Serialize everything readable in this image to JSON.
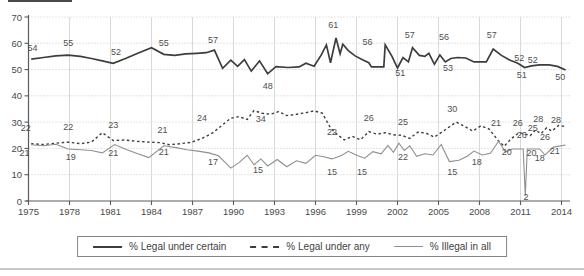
{
  "colors": {
    "line_dark": "#3d3d3d",
    "line_light": "#8f8f8f",
    "grid_vertical": "#d9d9d9",
    "grid_horizontal": "#c9c9c9",
    "axis": "#5a5a5a",
    "tick_text": "#4a4a4a",
    "data_label": "#4f4f4f",
    "divider": "#c9c9c9"
  },
  "chart_data": {
    "type": "line",
    "title": "",
    "xlabel": "",
    "ylabel": "",
    "xlim": [
      1975,
      2014.7
    ],
    "ylim": [
      0,
      70
    ],
    "grid": true,
    "legend_position": "bottom",
    "x_ticks": [
      1975,
      1978,
      1981,
      1984,
      1987,
      1990,
      1993,
      1996,
      1999,
      2002,
      2005,
      2008,
      2011,
      2014
    ],
    "y_ticks": [
      0,
      10,
      20,
      30,
      40,
      50,
      60,
      70
    ],
    "series": [
      {
        "name": "% Legal under certain",
        "style": "solid-thick",
        "points": [
          [
            1975.2,
            54
          ],
          [
            1976.1,
            54.6
          ],
          [
            1977.0,
            55.2
          ],
          [
            1977.9,
            55.5
          ],
          [
            1978.8,
            55.0
          ],
          [
            1979.6,
            54.2
          ],
          [
            1980.4,
            53.3
          ],
          [
            1981.2,
            52.4
          ],
          [
            1982.1,
            54.2
          ],
          [
            1983.0,
            56.2
          ],
          [
            1984.0,
            58.3
          ],
          [
            1984.9,
            55.8
          ],
          [
            1985.7,
            55.4
          ],
          [
            1986.5,
            56.0
          ],
          [
            1987.3,
            56.2
          ],
          [
            1988.0,
            56.4
          ],
          [
            1988.6,
            57.4
          ],
          [
            1989.2,
            50.5
          ],
          [
            1989.8,
            53.6
          ],
          [
            1990.3,
            51.2
          ],
          [
            1990.8,
            53.8
          ],
          [
            1991.3,
            49.4
          ],
          [
            1991.9,
            53.3
          ],
          [
            1992.5,
            48.4
          ],
          [
            1993.1,
            51.1
          ],
          [
            1994.0,
            50.8
          ],
          [
            1994.8,
            51.0
          ],
          [
            1995.3,
            52.4
          ],
          [
            1995.9,
            51.3
          ],
          [
            1996.4,
            55.4
          ],
          [
            1996.8,
            59.4
          ],
          [
            1997.1,
            52.6
          ],
          [
            1997.5,
            62.0
          ],
          [
            1997.8,
            56.0
          ],
          [
            1998.0,
            59.6
          ],
          [
            1998.4,
            57.2
          ],
          [
            1998.9,
            55.2
          ],
          [
            1999.4,
            53.8
          ],
          [
            1999.9,
            52.6
          ],
          [
            2000.1,
            51.0
          ],
          [
            2001.0,
            51.0
          ],
          [
            2001.1,
            59.4
          ],
          [
            2001.6,
            55.0
          ],
          [
            2002.0,
            50.6
          ],
          [
            2002.4,
            54.6
          ],
          [
            2002.8,
            52.9
          ],
          [
            2003.1,
            58.3
          ],
          [
            2003.6,
            55.4
          ],
          [
            2004.0,
            55.0
          ],
          [
            2004.3,
            56.2
          ],
          [
            2004.7,
            52.0
          ],
          [
            2005.1,
            55.6
          ],
          [
            2005.5,
            52.9
          ],
          [
            2005.9,
            54.2
          ],
          [
            2006.4,
            54.6
          ],
          [
            2007.0,
            54.4
          ],
          [
            2007.6,
            52.9
          ],
          [
            2008.5,
            52.9
          ],
          [
            2009.0,
            57.8
          ],
          [
            2009.6,
            55.4
          ],
          [
            2010.2,
            53.6
          ],
          [
            2010.8,
            52.4
          ],
          [
            2011.3,
            50.8
          ],
          [
            2011.8,
            51.4
          ],
          [
            2012.4,
            51.8
          ],
          [
            2013.1,
            51.8
          ],
          [
            2013.7,
            51.2
          ],
          [
            2014.3,
            49.8
          ]
        ],
        "labels": [
          {
            "x": 1975.3,
            "y": 58.2,
            "t": "54"
          },
          {
            "x": 1977.9,
            "y": 60.1,
            "t": "55"
          },
          {
            "x": 1981.4,
            "y": 56.7,
            "t": "52"
          },
          {
            "x": 1984.9,
            "y": 60.1,
            "t": "55"
          },
          {
            "x": 1988.5,
            "y": 61.2,
            "t": "57"
          },
          {
            "x": 1992.5,
            "y": 43.7,
            "t": "48"
          },
          {
            "x": 1997.3,
            "y": 66.9,
            "t": "61"
          },
          {
            "x": 1999.8,
            "y": 60.5,
            "t": "56"
          },
          {
            "x": 2002.9,
            "y": 63.1,
            "t": "57"
          },
          {
            "x": 2002.2,
            "y": 48.7,
            "t": "51"
          },
          {
            "x": 2005.4,
            "y": 62.4,
            "t": "56"
          },
          {
            "x": 2005.7,
            "y": 50.6,
            "t": "53"
          },
          {
            "x": 2008.9,
            "y": 63.1,
            "t": "57"
          },
          {
            "x": 2010.9,
            "y": 54.4,
            "t": "52"
          },
          {
            "x": 2011.9,
            "y": 53.6,
            "t": "52"
          },
          {
            "x": 2011.1,
            "y": 47.9,
            "t": "51"
          },
          {
            "x": 2013.9,
            "y": 47.2,
            "t": "50"
          }
        ]
      },
      {
        "name": "% Legal under any",
        "style": "dashed",
        "points": [
          [
            1975.2,
            21.8
          ],
          [
            1976.1,
            21.5
          ],
          [
            1977.0,
            22.0
          ],
          [
            1977.9,
            22.4
          ],
          [
            1978.8,
            21.8
          ],
          [
            1979.6,
            22.4
          ],
          [
            1980.4,
            26.0
          ],
          [
            1981.2,
            23.0
          ],
          [
            1982.0,
            23.2
          ],
          [
            1982.9,
            22.7
          ],
          [
            1983.8,
            22.4
          ],
          [
            1984.6,
            22.2
          ],
          [
            1985.3,
            21.4
          ],
          [
            1986.1,
            21.8
          ],
          [
            1986.9,
            22.3
          ],
          [
            1987.7,
            23.8
          ],
          [
            1988.5,
            26.0
          ],
          [
            1989.2,
            29.0
          ],
          [
            1989.8,
            31.5
          ],
          [
            1990.4,
            32.1
          ],
          [
            1991.0,
            31.0
          ],
          [
            1991.5,
            34.4
          ],
          [
            1992.1,
            33.4
          ],
          [
            1992.7,
            33.0
          ],
          [
            1993.3,
            34.0
          ],
          [
            1993.9,
            32.5
          ],
          [
            1994.6,
            33.0
          ],
          [
            1995.3,
            33.6
          ],
          [
            1995.9,
            34.3
          ],
          [
            1996.5,
            33.4
          ],
          [
            1997.1,
            27.8
          ],
          [
            1997.6,
            25.3
          ],
          [
            1998.1,
            23.2
          ],
          [
            1998.7,
            24.6
          ],
          [
            1999.3,
            23.3
          ],
          [
            1999.9,
            26.4
          ],
          [
            2000.5,
            25.4
          ],
          [
            2001.1,
            26.0
          ],
          [
            2001.7,
            25.2
          ],
          [
            2002.3,
            25.0
          ],
          [
            2002.9,
            23.8
          ],
          [
            2003.5,
            26.2
          ],
          [
            2004.1,
            25.8
          ],
          [
            2004.7,
            24.3
          ],
          [
            2005.3,
            26.4
          ],
          [
            2005.9,
            28.6
          ],
          [
            2006.3,
            30.0
          ],
          [
            2006.9,
            28.4
          ],
          [
            2007.5,
            26.6
          ],
          [
            2008.1,
            28.6
          ],
          [
            2008.7,
            27.4
          ],
          [
            2009.3,
            23.4
          ],
          [
            2009.8,
            20.8
          ],
          [
            2010.3,
            23.6
          ],
          [
            2010.9,
            26.0
          ],
          [
            2011.3,
            25.6
          ],
          [
            2011.7,
            24.8
          ],
          [
            2012.1,
            27.0
          ],
          [
            2012.5,
            25.6
          ],
          [
            2012.9,
            27.8
          ],
          [
            2013.3,
            26.6
          ],
          [
            2013.8,
            28.8
          ],
          [
            2014.3,
            28.3
          ]
        ],
        "labels": [
          {
            "x": 1974.8,
            "y": 27.8,
            "t": "22"
          },
          {
            "x": 1977.9,
            "y": 28.1,
            "t": "22"
          },
          {
            "x": 1981.2,
            "y": 28.9,
            "t": "23"
          },
          {
            "x": 1984.8,
            "y": 27.0,
            "t": "21"
          },
          {
            "x": 1987.7,
            "y": 31.6,
            "t": "24"
          },
          {
            "x": 1992.0,
            "y": 31.2,
            "t": "34"
          },
          {
            "x": 1997.2,
            "y": 26.2,
            "t": "22"
          },
          {
            "x": 1999.9,
            "y": 31.6,
            "t": "26"
          },
          {
            "x": 2002.4,
            "y": 29.9,
            "t": "25"
          },
          {
            "x": 2006.0,
            "y": 35.0,
            "t": "30"
          },
          {
            "x": 2009.2,
            "y": 29.7,
            "t": "21"
          },
          {
            "x": 2010.8,
            "y": 29.7,
            "t": "26"
          },
          {
            "x": 2011.1,
            "y": 25.1,
            "t": "26"
          },
          {
            "x": 2011.9,
            "y": 27.8,
            "t": "25"
          },
          {
            "x": 2012.3,
            "y": 31.2,
            "t": "28"
          },
          {
            "x": 2012.8,
            "y": 24.3,
            "t": "26"
          },
          {
            "x": 2013.6,
            "y": 30.8,
            "t": "28"
          }
        ]
      },
      {
        "name": "% Illegal in all",
        "style": "solid-thin",
        "points": [
          [
            1975.2,
            21.4
          ],
          [
            1976.1,
            21.0
          ],
          [
            1977.0,
            21.6
          ],
          [
            1977.9,
            19.8
          ],
          [
            1978.8,
            19.5
          ],
          [
            1979.6,
            19.2
          ],
          [
            1980.4,
            18.3
          ],
          [
            1981.3,
            21.5
          ],
          [
            1982.2,
            19.5
          ],
          [
            1983.0,
            18.0
          ],
          [
            1983.8,
            16.5
          ],
          [
            1984.9,
            21.0
          ],
          [
            1985.8,
            20.3
          ],
          [
            1986.6,
            19.5
          ],
          [
            1987.4,
            19.0
          ],
          [
            1988.2,
            18.3
          ],
          [
            1988.9,
            17.2
          ],
          [
            1989.8,
            12.5
          ],
          [
            1990.4,
            14.6
          ],
          [
            1991.0,
            17.4
          ],
          [
            1991.5,
            13.8
          ],
          [
            1992.0,
            16.0
          ],
          [
            1992.5,
            13.3
          ],
          [
            1993.2,
            15.8
          ],
          [
            1993.9,
            13.0
          ],
          [
            1994.6,
            15.3
          ],
          [
            1995.3,
            14.3
          ],
          [
            1996.0,
            17.4
          ],
          [
            1996.6,
            16.8
          ],
          [
            1997.2,
            16.0
          ],
          [
            1997.9,
            17.3
          ],
          [
            1998.4,
            18.9
          ],
          [
            1999.1,
            17.2
          ],
          [
            1999.6,
            16.3
          ],
          [
            2000.2,
            18.8
          ],
          [
            2000.8,
            17.9
          ],
          [
            2001.3,
            21.2
          ],
          [
            2001.7,
            18.5
          ],
          [
            2002.1,
            22.0
          ],
          [
            2002.5,
            19.2
          ],
          [
            2002.9,
            21.0
          ],
          [
            2003.4,
            17.0
          ],
          [
            2004.0,
            18.0
          ],
          [
            2004.6,
            17.5
          ],
          [
            2005.2,
            21.5
          ],
          [
            2005.8,
            15.0
          ],
          [
            2006.5,
            15.5
          ],
          [
            2007.1,
            17.0
          ],
          [
            2007.6,
            19.0
          ],
          [
            2008.2,
            17.5
          ],
          [
            2008.8,
            18.2
          ],
          [
            2009.4,
            22.7
          ],
          [
            2009.9,
            18.6
          ],
          [
            2010.4,
            19.8
          ],
          [
            2011.2,
            19.8
          ],
          [
            2011.35,
            2.0
          ],
          [
            2011.5,
            19.8
          ],
          [
            2012.4,
            19.8
          ],
          [
            2012.8,
            17.5
          ],
          [
            2013.4,
            20.5
          ],
          [
            2014.3,
            21.3
          ]
        ],
        "labels": [
          {
            "x": 1974.7,
            "y": 18.3,
            "t": "21"
          },
          {
            "x": 1978.1,
            "y": 16.7,
            "t": "19"
          },
          {
            "x": 1981.2,
            "y": 18.3,
            "t": "21"
          },
          {
            "x": 1984.9,
            "y": 18.6,
            "t": "21"
          },
          {
            "x": 1988.5,
            "y": 14.8,
            "t": "17"
          },
          {
            "x": 1991.8,
            "y": 11.8,
            "t": "15"
          },
          {
            "x": 1997.2,
            "y": 11.0,
            "t": "15"
          },
          {
            "x": 1999.4,
            "y": 11.0,
            "t": "15"
          },
          {
            "x": 2002.4,
            "y": 16.7,
            "t": "22"
          },
          {
            "x": 2006.0,
            "y": 11.0,
            "t": "15"
          },
          {
            "x": 2007.8,
            "y": 14.8,
            "t": "18"
          },
          {
            "x": 2010.0,
            "y": 18.6,
            "t": "20"
          },
          {
            "x": 2011.4,
            "y": 1.5,
            "t": "2"
          },
          {
            "x": 2011.8,
            "y": 18.3,
            "t": "20"
          },
          {
            "x": 2012.4,
            "y": 16.3,
            "t": "18"
          },
          {
            "x": 2013.5,
            "y": 19.0,
            "t": "21"
          }
        ]
      }
    ]
  }
}
